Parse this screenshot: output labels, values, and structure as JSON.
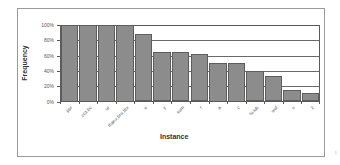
{
  "chart_data": {
    "type": "bar",
    "title": "",
    "xlabel": "Instance",
    "ylabel": "Frequency",
    "ylim": [
      0,
      100
    ],
    "yticks": [
      "0%",
      "20%",
      "40%",
      "60%",
      "80%",
      "100%"
    ],
    "grid": true,
    "legend": null,
    "categories": [
      "ppr",
      "coz.bc",
      "ur",
      "thanx.bnx.tbx",
      "u",
      "y",
      "sum",
      "r",
      "a",
      "c",
      "lu.lub",
      "wuf",
      "n",
      "2"
    ],
    "values": [
      100,
      100,
      100,
      100,
      88,
      65,
      65,
      62,
      50,
      50,
      40,
      33,
      15,
      11
    ],
    "unit": "%"
  },
  "colors": {
    "bar_fill": "#8c8c8c",
    "bar_border": "#5e5e5e",
    "gridline": "#6a6a6a",
    "frame_border": "#9a9a9a",
    "text": "#555555"
  },
  "page_mark": "1"
}
